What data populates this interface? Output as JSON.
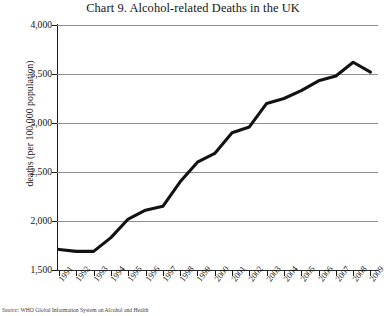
{
  "chart_data": {
    "type": "line",
    "title": "Chart 9. Alcohol-related Deaths in the UK",
    "xlabel": "",
    "ylabel": "deaths (per 100,000 population)",
    "ylim": [
      1500,
      4000
    ],
    "ytick_step": 500,
    "ytick_labels": [
      "4,000",
      "3,500",
      "3,000",
      "2,500",
      "2,000",
      "1,500"
    ],
    "ytick_values": [
      4000,
      3500,
      3000,
      2500,
      2000,
      1500
    ],
    "grid": true,
    "grid_axis": "y",
    "legend": "none",
    "line_color": "#121212",
    "categories": [
      "1991",
      "1992",
      "1993",
      "1994",
      "1995",
      "1996",
      "1997",
      "1998",
      "1999",
      "2000",
      "2001",
      "2002",
      "2003",
      "2004",
      "2005",
      "2006",
      "2007",
      "2008",
      "2009"
    ],
    "x": [
      1991,
      1992,
      1993,
      1994,
      1995,
      1996,
      1997,
      1998,
      1999,
      2000,
      2001,
      2002,
      2003,
      2004,
      2005,
      2006,
      2007,
      2008,
      2009
    ],
    "values": [
      1710,
      1690,
      1690,
      1830,
      2020,
      2110,
      2150,
      2400,
      2600,
      2690,
      2900,
      2960,
      3200,
      3250,
      3330,
      3430,
      3480,
      3620,
      3520
    ]
  },
  "source": {
    "label": "Source:",
    "text": "WHO Global Information System on Alcohol and Health"
  }
}
